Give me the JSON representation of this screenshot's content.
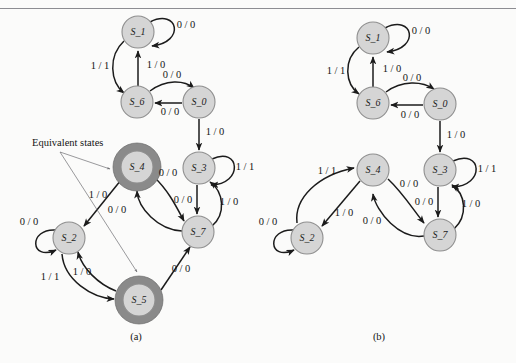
{
  "figure": {
    "type": "state-transition-diagram",
    "panels": [
      {
        "id": "a",
        "caption": "(a)",
        "caption_pos": {
          "x": 136,
          "y": 338
        },
        "annotation": {
          "text": "Equivalent states",
          "pos": {
            "x": 32,
            "y": 144
          }
        },
        "nodes": [
          {
            "id": "S_1",
            "label": "S_1",
            "cx": 138,
            "cy": 32,
            "r": 16,
            "highlight": false
          },
          {
            "id": "S_6",
            "label": "S_6",
            "cx": 137,
            "cy": 102,
            "r": 16,
            "highlight": false
          },
          {
            "id": "S_0",
            "label": "S_0",
            "cx": 199,
            "cy": 102,
            "r": 16,
            "highlight": false
          },
          {
            "id": "S_3",
            "label": "S_3",
            "cx": 199,
            "cy": 168,
            "r": 16,
            "highlight": false
          },
          {
            "id": "S_7",
            "label": "S_7",
            "cx": 198,
            "cy": 232,
            "r": 16,
            "highlight": false
          },
          {
            "id": "S_4",
            "label": "S_4",
            "cx": 137,
            "cy": 167,
            "r": 16,
            "highlight": true,
            "r_outer": 24
          },
          {
            "id": "S_2",
            "label": "S_2",
            "cx": 69,
            "cy": 238,
            "r": 16,
            "highlight": false
          },
          {
            "id": "S_5",
            "label": "S_5",
            "cx": 139,
            "cy": 300,
            "r": 16,
            "highlight": true,
            "r_outer": 24
          }
        ],
        "edges": [
          {
            "from": "S_1",
            "to": "S_1",
            "label": "0 / 0",
            "label_pos": {
              "x": 186,
              "y": 26
            }
          },
          {
            "from": "S_1",
            "to": "S_6",
            "label": "1 / 1",
            "label_pos": {
              "x": 100,
              "y": 67
            }
          },
          {
            "from": "S_6",
            "to": "S_1",
            "label": "1 / 0",
            "label_pos": {
              "x": 156,
              "y": 66
            }
          },
          {
            "from": "S_6",
            "to": "S_0",
            "label": "0 / 0",
            "label_pos": {
              "x": 172,
              "y": 76
            }
          },
          {
            "from": "S_0",
            "to": "S_6",
            "label": "0 / 0",
            "label_pos": {
              "x": 170,
              "y": 113
            }
          },
          {
            "from": "S_0",
            "to": "S_3",
            "label": "1 / 0",
            "label_pos": {
              "x": 215,
              "y": 133
            }
          },
          {
            "from": "S_3",
            "to": "S_3",
            "label": "1 / 1",
            "label_pos": {
              "x": 245,
              "y": 168
            }
          },
          {
            "from": "S_3",
            "to": "S_7",
            "label": "0 / 0",
            "label_pos": {
              "x": 183,
              "y": 201
            }
          },
          {
            "from": "S_7",
            "to": "S_3",
            "label": "1 / 0",
            "label_pos": {
              "x": 229,
              "y": 203
            }
          },
          {
            "from": "S_4",
            "to": "S_2",
            "label": "1 / 0",
            "label_pos": {
              "x": 98,
              "y": 196
            }
          },
          {
            "from": "S_4",
            "to": "S_7",
            "label": "0 / 0",
            "label_pos": {
              "x": 168,
              "y": 174
            }
          },
          {
            "from": "S_7",
            "to": "S_4",
            "label": "0 / 0",
            "label_pos": {
              "x": 117,
              "y": 211
            }
          },
          {
            "from": "S_2",
            "to": "S_2",
            "label": "0 / 0",
            "label_pos": {
              "x": 29,
              "y": 223
            }
          },
          {
            "from": "S_2",
            "to": "S_5",
            "label": "1 / 1",
            "label_pos": {
              "x": 50,
              "y": 278
            }
          },
          {
            "from": "S_5",
            "to": "S_2",
            "label": "1 / 0",
            "label_pos": {
              "x": 82,
              "y": 273
            }
          },
          {
            "from": "S_5",
            "to": "S_7",
            "label": "0 / 0",
            "label_pos": {
              "x": 181,
              "y": 270
            }
          }
        ]
      },
      {
        "id": "b",
        "caption": "(b)",
        "caption_pos": {
          "x": 379,
          "y": 338
        },
        "nodes": [
          {
            "id": "S_1",
            "label": "S_1",
            "cx": 373,
            "cy": 38,
            "r": 16,
            "highlight": false
          },
          {
            "id": "S_6",
            "label": "S_6",
            "cx": 373,
            "cy": 103,
            "r": 16,
            "highlight": false
          },
          {
            "id": "S_0",
            "label": "S_0",
            "cx": 440,
            "cy": 104,
            "r": 16,
            "highlight": false
          },
          {
            "id": "S_3",
            "label": "S_3",
            "cx": 440,
            "cy": 170,
            "r": 16,
            "highlight": false
          },
          {
            "id": "S_4",
            "label": "S_4",
            "cx": 373,
            "cy": 170,
            "r": 16,
            "highlight": false
          },
          {
            "id": "S_7",
            "label": "S_7",
            "cx": 440,
            "cy": 235,
            "r": 16,
            "highlight": false
          },
          {
            "id": "S_2",
            "label": "S_2",
            "cx": 307,
            "cy": 238,
            "r": 16,
            "highlight": false
          }
        ],
        "edges": [
          {
            "from": "S_1",
            "to": "S_1",
            "label": "0 / 0",
            "label_pos": {
              "x": 421,
              "y": 32
            }
          },
          {
            "from": "S_1",
            "to": "S_6",
            "label": "1 / 1",
            "label_pos": {
              "x": 336,
              "y": 72
            }
          },
          {
            "from": "S_6",
            "to": "S_1",
            "label": "1 / 0",
            "label_pos": {
              "x": 392,
              "y": 70
            }
          },
          {
            "from": "S_6",
            "to": "S_0",
            "label": "0 / 0",
            "label_pos": {
              "x": 412,
              "y": 79
            }
          },
          {
            "from": "S_0",
            "to": "S_6",
            "label": "0 / 0",
            "label_pos": {
              "x": 410,
              "y": 116
            }
          },
          {
            "from": "S_0",
            "to": "S_3",
            "label": "1 / 0",
            "label_pos": {
              "x": 456,
              "y": 136
            }
          },
          {
            "from": "S_3",
            "to": "S_3",
            "label": "1 / 1",
            "label_pos": {
              "x": 487,
              "y": 170
            }
          },
          {
            "from": "S_3",
            "to": "S_7",
            "label": "0 / 0",
            "label_pos": {
              "x": 424,
              "y": 203
            }
          },
          {
            "from": "S_7",
            "to": "S_3",
            "label": "1 / 0",
            "label_pos": {
              "x": 471,
              "y": 205
            }
          },
          {
            "from": "S_2",
            "to": "S_4",
            "label": "1 / 1",
            "label_pos": {
              "x": 327,
              "y": 172
            }
          },
          {
            "from": "S_4",
            "to": "S_2",
            "label": "1 / 0",
            "label_pos": {
              "x": 344,
              "y": 214
            }
          },
          {
            "from": "S_4",
            "to": "S_7",
            "label": "0 / 0",
            "label_pos": {
              "x": 409,
              "y": 185
            }
          },
          {
            "from": "S_7",
            "to": "S_4",
            "label": "0 / 0",
            "label_pos": {
              "x": 372,
              "y": 222
            }
          },
          {
            "from": "S_2",
            "to": "S_2",
            "label": "0 / 0",
            "label_pos": {
              "x": 268,
              "y": 223
            }
          }
        ]
      }
    ]
  }
}
